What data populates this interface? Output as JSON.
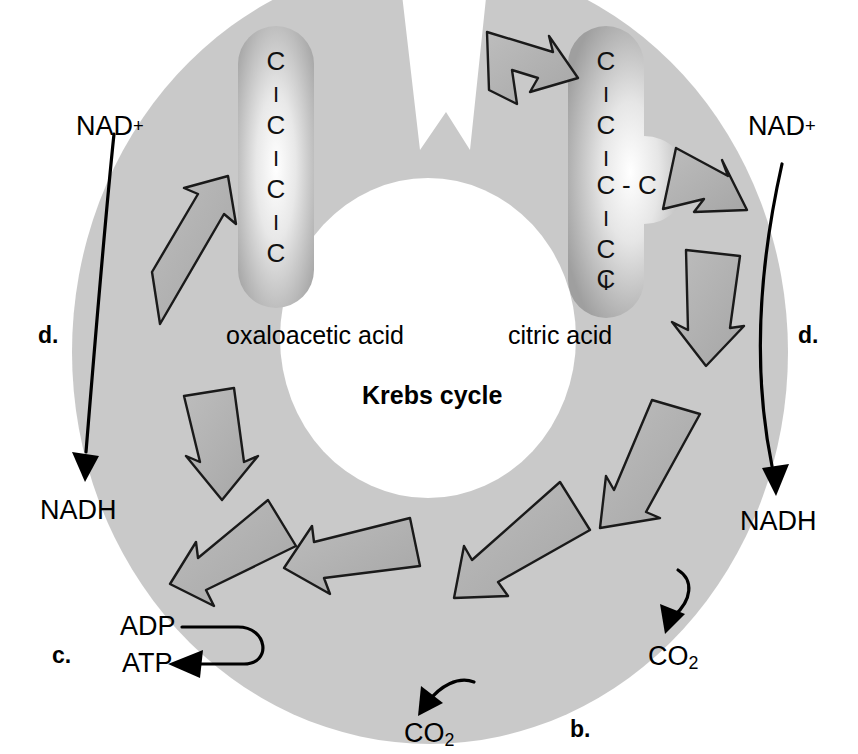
{
  "figure": {
    "title_center": "Krebs cycle",
    "background_color": "#ffffff",
    "ring_color": "#c9c9c9",
    "arrow_fill": "#b3b3b3",
    "arrow_stroke": "#1a1a1a",
    "capsule_color": "#a8a8a8"
  },
  "molecules": {
    "oxaloacetic": {
      "name": "oxaloacetic acid",
      "carbons": [
        "C",
        "C",
        "C",
        "C"
      ],
      "bond": "I",
      "branch": null
    },
    "citric": {
      "name": "citric acid",
      "carbons": [
        "C",
        "C",
        "C",
        "C",
        "C"
      ],
      "bond": "I",
      "branch": "- C",
      "branch_index": 2
    }
  },
  "cofactors": {
    "nad_left_in": "NAD",
    "nad_left_in_charge": "+",
    "nadh_left_out": "NADH",
    "nad_right_in": "NAD",
    "nad_right_in_charge": "+",
    "nadh_right_out": "NADH",
    "adp": "ADP",
    "atp": "ATP",
    "co2_right": "CO",
    "co2_right_sub": "2",
    "co2_bottom": "CO",
    "co2_bottom_sub": "2"
  },
  "steps": {
    "b": "b.",
    "c": "c.",
    "d_left": "d.",
    "d_right": "d."
  }
}
